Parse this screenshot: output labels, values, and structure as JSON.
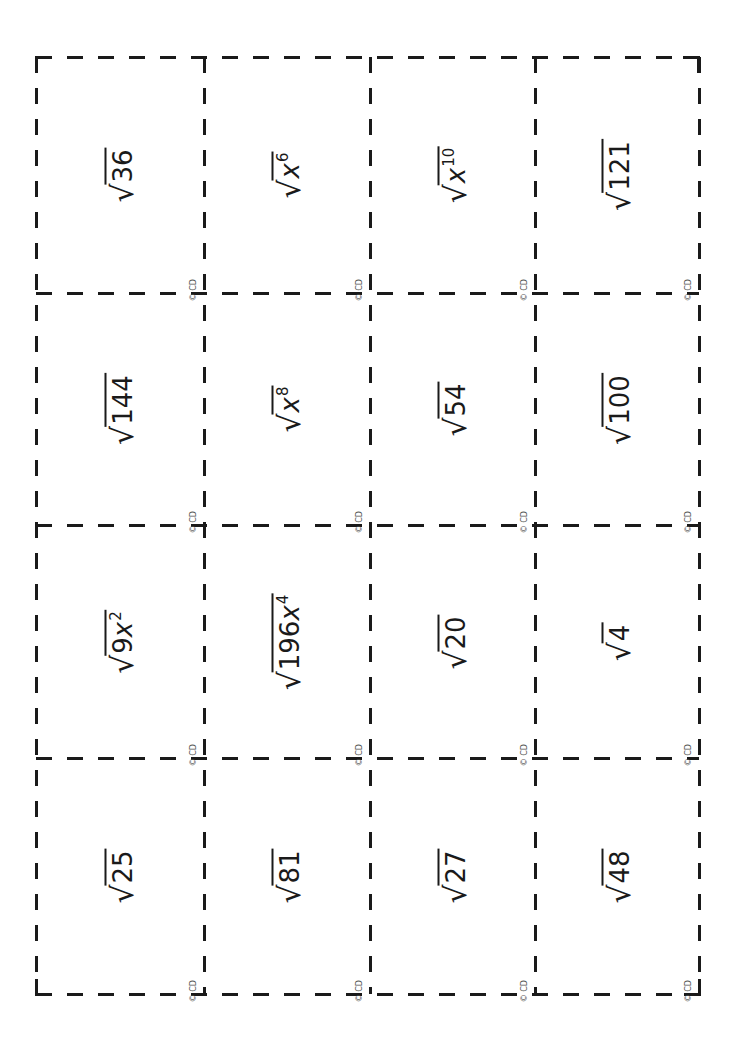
{
  "sheet": {
    "columns": 4,
    "rows": 4,
    "copyright_mark": "© CD",
    "line_color": "#1a1a1a",
    "background": "#ffffff"
  },
  "cards": [
    {
      "row": 0,
      "col": 0,
      "radicand": "36",
      "exponent": ""
    },
    {
      "row": 0,
      "col": 1,
      "radicand": "x",
      "exponent": "6"
    },
    {
      "row": 0,
      "col": 2,
      "radicand": "x",
      "exponent": "10"
    },
    {
      "row": 0,
      "col": 3,
      "radicand": "121",
      "exponent": ""
    },
    {
      "row": 1,
      "col": 0,
      "radicand": "144",
      "exponent": ""
    },
    {
      "row": 1,
      "col": 1,
      "radicand": "x",
      "exponent": "8"
    },
    {
      "row": 1,
      "col": 2,
      "radicand": "54",
      "exponent": ""
    },
    {
      "row": 1,
      "col": 3,
      "radicand": "100",
      "exponent": ""
    },
    {
      "row": 2,
      "col": 0,
      "radicand": "9x",
      "exponent": "2"
    },
    {
      "row": 2,
      "col": 1,
      "radicand": "196x",
      "exponent": "4"
    },
    {
      "row": 2,
      "col": 2,
      "radicand": "20",
      "exponent": ""
    },
    {
      "row": 2,
      "col": 3,
      "radicand": "4",
      "exponent": ""
    },
    {
      "row": 3,
      "col": 0,
      "radicand": "25",
      "exponent": ""
    },
    {
      "row": 3,
      "col": 1,
      "radicand": "81",
      "exponent": ""
    },
    {
      "row": 3,
      "col": 2,
      "radicand": "27",
      "exponent": ""
    },
    {
      "row": 3,
      "col": 3,
      "radicand": "48",
      "exponent": ""
    }
  ],
  "radical_symbol": "√"
}
